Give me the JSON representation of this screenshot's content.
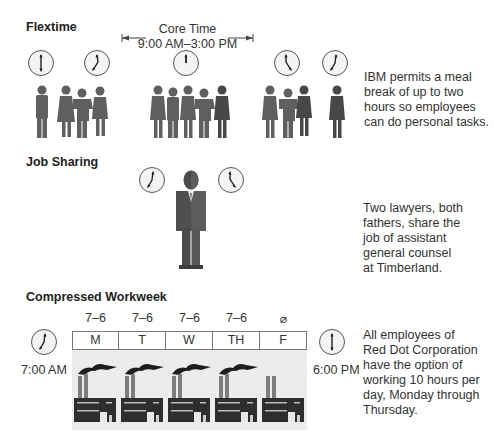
{
  "flextime": {
    "title": "Flextime",
    "core_time_label": "Core Time",
    "core_time_range": "9:00 AM–3:00 PM",
    "description": "IBM permits a meal break of up to two hours so employees can do personal tasks.",
    "description_lines": [
      "IBM permits a meal",
      "break of up to two",
      "hours so employees",
      "can do personal tasks."
    ]
  },
  "job_sharing": {
    "title": "Job Sharing",
    "description_lines": [
      "Two lawyers, both",
      "fathers, share the",
      "job of assistant",
      "general counsel",
      "at Timberland."
    ]
  },
  "compressed_workweek": {
    "title": "Compressed Workweek",
    "start_time": "7:00 AM",
    "end_time": "6:00 PM",
    "days": [
      {
        "label": "M",
        "hours": "7–6"
      },
      {
        "label": "T",
        "hours": "7–6"
      },
      {
        "label": "W",
        "hours": "7–6"
      },
      {
        "label": "TH",
        "hours": "7–6"
      },
      {
        "label": "F",
        "hours": "⌀"
      }
    ],
    "description_lines": [
      "All employees of",
      "Red Dot Corporation",
      "have the option of",
      "working 10 hours per",
      "day, Monday through",
      "Thursday."
    ]
  },
  "colors": {
    "silhouette": "#5f5f5f",
    "silhouette_dark": "#474747",
    "factory": "#2e2e2e",
    "smoke": "#1e1e1e",
    "factory_bg": "#ececec"
  }
}
